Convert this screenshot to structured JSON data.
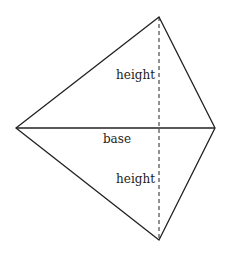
{
  "diagram": {
    "type": "kite",
    "vertices": {
      "left": [
        16,
        128
      ],
      "right": [
        215,
        128
      ],
      "top": [
        159,
        17
      ],
      "bottom": [
        159,
        240
      ]
    },
    "labels": {
      "height_top": "height",
      "base": "base",
      "height_bottom": "height"
    },
    "colors": {
      "stroke": "#222222",
      "background": "#ffffff"
    }
  }
}
